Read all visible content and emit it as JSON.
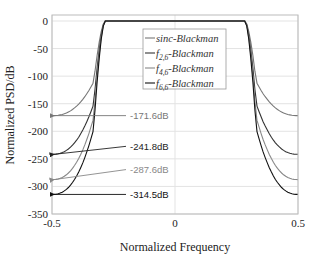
{
  "chart_data": {
    "type": "line",
    "title": "",
    "xlabel": "Normalized Frequency",
    "ylabel": "Normalized PSD/dB",
    "xlim": [
      -0.5,
      0.5
    ],
    "ylim": [
      -350,
      5
    ],
    "xticks": [
      -0.5,
      0,
      0.5
    ],
    "xtick_labels": [
      "-0.5",
      "0",
      "0.5"
    ],
    "yticks": [
      0,
      -50,
      -100,
      -150,
      -200,
      -250,
      -300,
      -350
    ],
    "ytick_labels": [
      "0",
      "-50",
      "-100",
      "-150",
      "-200",
      "-250",
      "-300",
      "-350"
    ],
    "grid": true,
    "legend_position": "upper-center-inside",
    "passband_edge": 0.3,
    "series": [
      {
        "name": "sinc-Blackman",
        "legend_main": "sinc",
        "legend_sub": "",
        "legend_suffix": "-Blackman",
        "color": "#777777",
        "edge_value_db": -171.6,
        "knee_db": -110
      },
      {
        "name": "f2,6-Blackman",
        "legend_main": "f",
        "legend_sub": "2,6",
        "legend_suffix": "-Blackman",
        "color": "#333333",
        "edge_value_db": -241.8,
        "knee_db": -150
      },
      {
        "name": "f4,6-Blackman",
        "legend_main": "f",
        "legend_sub": "4,6",
        "legend_suffix": "-Blackman",
        "color": "#888888",
        "edge_value_db": -287.6,
        "knee_db": -175
      },
      {
        "name": "f6,6-Blackman",
        "legend_main": "f",
        "legend_sub": "6,6",
        "legend_suffix": "-Blackman",
        "color": "#111111",
        "edge_value_db": -314.5,
        "knee_db": -195
      }
    ],
    "annotations": [
      {
        "text": "-171.6dB",
        "value": -171.6,
        "color": "#777777"
      },
      {
        "text": "-241.8dB",
        "value": -241.8,
        "color": "#222222"
      },
      {
        "text": "-287.6dB",
        "value": -287.6,
        "color": "#888888"
      },
      {
        "text": "-314.5dB",
        "value": -314.5,
        "color": "#111111"
      }
    ]
  }
}
